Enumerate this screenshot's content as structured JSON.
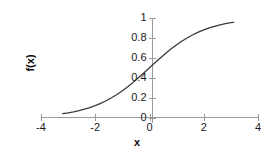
{
  "chart_data": {
    "type": "line",
    "title": "",
    "xlabel": "x",
    "ylabel": "f(x)",
    "xlim": [
      -4,
      4
    ],
    "ylim": [
      0,
      1
    ],
    "grid": false,
    "legend": null,
    "x_ticks": [
      "-4",
      "-2",
      "0",
      "2",
      "4"
    ],
    "x_tick_values": [
      -4,
      -2,
      0,
      2,
      4
    ],
    "y_ticks": [
      "0",
      "0.2",
      "0.4",
      "0.6",
      "0.8",
      "1"
    ],
    "y_tick_values": [
      0,
      0.2,
      0.4,
      0.6,
      0.8,
      1
    ],
    "series": [
      {
        "name": "f(x)",
        "color": "#3a3a3a",
        "x": [
          -3.2,
          -3.0,
          -2.8,
          -2.6,
          -2.4,
          -2.2,
          -2.0,
          -1.8,
          -1.6,
          -1.4,
          -1.2,
          -1.0,
          -0.8,
          -0.6,
          -0.4,
          -0.2,
          0.0,
          0.2,
          0.4,
          0.6,
          0.8,
          1.0,
          1.2,
          1.4,
          1.6,
          1.8,
          2.0,
          2.2,
          2.4,
          2.6,
          2.8,
          3.0,
          3.1
        ],
        "values": [
          0.039,
          0.047,
          0.057,
          0.069,
          0.083,
          0.1,
          0.119,
          0.142,
          0.168,
          0.198,
          0.231,
          0.269,
          0.31,
          0.354,
          0.401,
          0.45,
          0.5,
          0.55,
          0.599,
          0.646,
          0.69,
          0.731,
          0.769,
          0.802,
          0.832,
          0.858,
          0.881,
          0.9,
          0.917,
          0.931,
          0.943,
          0.953,
          0.957
        ]
      }
    ]
  },
  "colors": {
    "axis": "#9a9a9a",
    "curve": "#3a3a3a",
    "text": "#1a1a1a",
    "background": "#ffffff"
  }
}
